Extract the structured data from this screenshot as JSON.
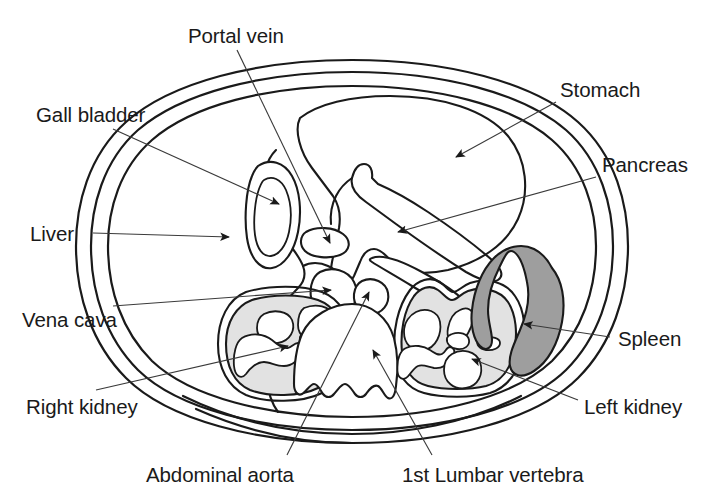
{
  "figure": {
    "background_color": "#ffffff",
    "line_color": "#1a1a1a",
    "leader_color": "#3a3a3a"
  },
  "labels": {
    "portal_vein": "Portal vein",
    "gall_bladder": "Gall bladder",
    "liver": "Liver",
    "vena_cava": "Vena cava",
    "right_kidney": "Right kidney",
    "abdominal_aorta": "Abdominal aorta",
    "first_lumbar_vertebra": "1st Lumbar vertebra",
    "left_kidney": "Left kidney",
    "spleen": "Spleen",
    "pancreas": "Pancreas",
    "stomach": "Stomach"
  },
  "structures": [
    {
      "name": "body-wall",
      "label": "Body wall",
      "fill": "#ffffff",
      "stroke": "#1a1a1a"
    },
    {
      "name": "stomach",
      "label": "Stomach",
      "fill": "#ffffff",
      "stroke": "#1a1a1a"
    },
    {
      "name": "liver",
      "label": "Liver",
      "fill": "#ffffff",
      "stroke": "#1a1a1a"
    },
    {
      "name": "gall-bladder",
      "label": "Gall bladder",
      "fill": "#ffffff",
      "stroke": "#1a1a1a"
    },
    {
      "name": "portal-vein",
      "label": "Portal vein",
      "fill": "#ffffff",
      "stroke": "#1a1a1a"
    },
    {
      "name": "vena-cava",
      "label": "Vena cava",
      "fill": "#ffffff",
      "stroke": "#1a1a1a"
    },
    {
      "name": "abdominal-aorta",
      "label": "Abdominal aorta",
      "fill": "#ffffff",
      "stroke": "#1a1a1a"
    },
    {
      "name": "pancreas",
      "label": "Pancreas",
      "fill": "#ffffff",
      "stroke": "#1a1a1a",
      "texture": "stippled"
    },
    {
      "name": "right-kidney",
      "label": "Right kidney",
      "fill": "#e2e2e2",
      "stroke": "#1a1a1a"
    },
    {
      "name": "left-kidney",
      "label": "Left kidney",
      "fill": "#e2e2e2",
      "stroke": "#1a1a1a"
    },
    {
      "name": "spleen",
      "label": "Spleen",
      "fill": "#9e9e9e",
      "stroke": "#1a1a1a"
    },
    {
      "name": "first-lumbar-vertebra",
      "label": "1st Lumbar vertebra",
      "fill": "#ffffff",
      "stroke": "#1a1a1a"
    }
  ]
}
